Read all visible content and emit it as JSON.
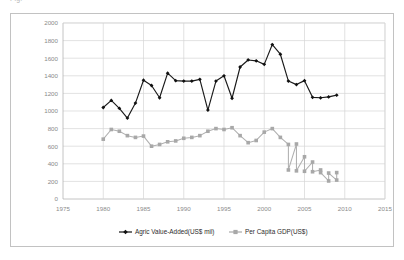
{
  "caption": {
    "fragment": "Fig."
  },
  "chart_data": {
    "type": "line",
    "title": "",
    "xlabel": "",
    "ylabel": "",
    "xlim": [
      1975,
      2015
    ],
    "ylim": [
      0,
      2000
    ],
    "xticks": [
      1975,
      1980,
      1985,
      1990,
      1995,
      2000,
      2005,
      2010,
      2015
    ],
    "yticks": [
      0,
      200,
      400,
      600,
      800,
      1000,
      1200,
      1400,
      1600,
      1800,
      2000
    ],
    "grid": true,
    "legend_position": "bottom",
    "x": [
      1980,
      1981,
      1982,
      1983,
      1984,
      1985,
      1986,
      1987,
      1988,
      1989,
      1990,
      1991,
      1992,
      1993,
      1994,
      1995,
      1996,
      1997,
      1998,
      1999,
      2000,
      2001,
      2002,
      2003,
      2004,
      2005,
      2006,
      2007,
      2008,
      2009
    ],
    "series": [
      {
        "name": "Agric Value-Added(US$ mil)",
        "color": "#111111",
        "marker": "diamond",
        "values": [
          1040,
          1120,
          1030,
          920,
          1090,
          1350,
          1290,
          1150,
          1430,
          1345,
          1340,
          1340,
          1360,
          1010,
          1340,
          1400,
          1145,
          1500,
          1580,
          1570,
          1530,
          1755,
          1645,
          1340,
          1300,
          1345,
          1155,
          1150,
          1160,
          1180
        ]
      },
      {
        "name": "Per Capita GDP(US$)",
        "color": "#a8a8a8",
        "marker": "square",
        "values": [
          680,
          790,
          770,
          720,
          700,
          715,
          600,
          620,
          650,
          660,
          690,
          700,
          720,
          770,
          800,
          790,
          810,
          720,
          640,
          665,
          760,
          800,
          700,
          620,
          625,
          480,
          420,
          330,
          205,
          215
        ]
      }
    ],
    "series_tail": {
      "name": "Per Capita GDP(US$)",
      "x_extra": [
        2003,
        2004,
        2005,
        2006,
        2007,
        2008,
        2009
      ],
      "values_extra": [
        330,
        320,
        315,
        310,
        300,
        295,
        300
      ]
    }
  },
  "legend": {
    "entries": [
      {
        "label": "Agric Value-Added(US$ mil)",
        "color": "#111111",
        "marker": "diamond"
      },
      {
        "label": "Per Capita GDP(US$)",
        "color": "#a8a8a8",
        "marker": "square"
      }
    ]
  }
}
